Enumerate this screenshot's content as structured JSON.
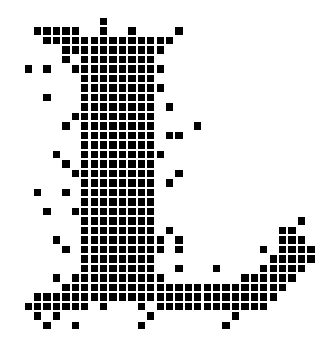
{
  "figure": {
    "fill_color": "#000000",
    "background_color": "#ffffff",
    "grid": {
      "origin_x": 34,
      "origin_y": 17.7,
      "pitch_x": 9.42,
      "pitch_y": 9.5,
      "cell_size": 7.4
    },
    "rows": [
      {
        "r": 0,
        "cols": [
          7
        ]
      },
      {
        "r": 1,
        "cols": [
          0,
          1,
          2,
          3,
          4,
          7,
          10,
          15
        ]
      },
      {
        "r": 2,
        "cols": [
          1,
          2,
          3,
          4,
          5,
          6,
          7,
          8,
          9,
          10,
          11,
          12,
          13,
          14
        ]
      },
      {
        "r": 3,
        "cols": [
          3,
          4,
          5,
          6,
          7,
          8,
          9,
          10,
          11,
          12,
          13
        ]
      },
      {
        "r": 4,
        "cols": [
          3,
          5,
          6,
          7,
          8,
          9,
          10,
          11,
          12
        ]
      },
      {
        "r": 5,
        "cols": [
          -1,
          1,
          4,
          5,
          6,
          7,
          8,
          9,
          10,
          11,
          12,
          13
        ]
      },
      {
        "r": 6,
        "cols": [
          5,
          6,
          7,
          8,
          9,
          10,
          11,
          12
        ]
      },
      {
        "r": 7,
        "cols": [
          5,
          6,
          7,
          8,
          9,
          10,
          11,
          12,
          13
        ]
      },
      {
        "r": 8,
        "cols": [
          1,
          5,
          6,
          7,
          8,
          9,
          10,
          11,
          12
        ]
      },
      {
        "r": 9,
        "cols": [
          5,
          6,
          7,
          8,
          9,
          10,
          11,
          12,
          14
        ]
      },
      {
        "r": 10,
        "cols": [
          4,
          5,
          6,
          7,
          8,
          9,
          10,
          11,
          12
        ]
      },
      {
        "r": 11,
        "cols": [
          3,
          5,
          6,
          7,
          8,
          9,
          10,
          11,
          12,
          17
        ]
      },
      {
        "r": 12,
        "cols": [
          5,
          6,
          7,
          8,
          9,
          10,
          11,
          12,
          14,
          15
        ]
      },
      {
        "r": 13,
        "cols": [
          5,
          6,
          7,
          8,
          9,
          10,
          11,
          12
        ]
      },
      {
        "r": 14,
        "cols": [
          2,
          5,
          6,
          7,
          8,
          9,
          10,
          11,
          12,
          13
        ]
      },
      {
        "r": 15,
        "cols": [
          3,
          5,
          6,
          7,
          8,
          9,
          10,
          11,
          12
        ]
      },
      {
        "r": 16,
        "cols": [
          4,
          5,
          6,
          7,
          8,
          9,
          10,
          11,
          12,
          15
        ]
      },
      {
        "r": 17,
        "cols": [
          5,
          6,
          7,
          8,
          9,
          10,
          11,
          12,
          14
        ]
      },
      {
        "r": 18,
        "cols": [
          0,
          3,
          5,
          6,
          7,
          8,
          9,
          10,
          11,
          12
        ]
      },
      {
        "r": 19,
        "cols": [
          5,
          6,
          7,
          8,
          9,
          10,
          11,
          12
        ]
      },
      {
        "r": 20,
        "cols": [
          1,
          4,
          5,
          6,
          7,
          8,
          9,
          10,
          11,
          12
        ]
      },
      {
        "r": 21,
        "cols": [
          5,
          6,
          7,
          8,
          9,
          10,
          11,
          12,
          28
        ]
      },
      {
        "r": 22,
        "cols": [
          5,
          6,
          7,
          8,
          9,
          10,
          11,
          12,
          14,
          26,
          27
        ]
      },
      {
        "r": 23,
        "cols": [
          2,
          5,
          6,
          7,
          8,
          9,
          10,
          11,
          12,
          13,
          15,
          26,
          27,
          28
        ]
      },
      {
        "r": 24,
        "cols": [
          3,
          5,
          6,
          7,
          8,
          9,
          10,
          11,
          12,
          13,
          15,
          24,
          26,
          27,
          28,
          29
        ]
      },
      {
        "r": 25,
        "cols": [
          5,
          6,
          7,
          8,
          9,
          10,
          11,
          12,
          25,
          26,
          27,
          28,
          29
        ]
      },
      {
        "r": 26,
        "cols": [
          5,
          6,
          7,
          8,
          9,
          10,
          11,
          12,
          15,
          19,
          24,
          25,
          26,
          27,
          28
        ]
      },
      {
        "r": 27,
        "cols": [
          2,
          4,
          5,
          6,
          7,
          8,
          9,
          10,
          11,
          12,
          13,
          22,
          23,
          24,
          25,
          26,
          27
        ]
      },
      {
        "r": 28,
        "cols": [
          3,
          4,
          5,
          6,
          7,
          8,
          9,
          10,
          11,
          12,
          13,
          14,
          15,
          16,
          17,
          18,
          19,
          20,
          21,
          22,
          23,
          24,
          25,
          26
        ]
      },
      {
        "r": 29,
        "cols": [
          0,
          1,
          2,
          3,
          4,
          5,
          6,
          7,
          8,
          9,
          10,
          11,
          12,
          13,
          14,
          15,
          16,
          17,
          18,
          19,
          20,
          21,
          22,
          23,
          24,
          25
        ]
      },
      {
        "r": 30,
        "cols": [
          -1,
          0,
          1,
          2,
          3,
          4,
          5,
          7,
          11,
          13,
          14,
          15,
          16,
          17,
          18,
          19,
          20,
          21,
          22,
          23,
          24
        ]
      },
      {
        "r": 31,
        "cols": [
          0,
          2,
          12,
          21
        ]
      },
      {
        "r": 32,
        "cols": [
          1,
          4,
          11,
          20
        ]
      }
    ]
  }
}
